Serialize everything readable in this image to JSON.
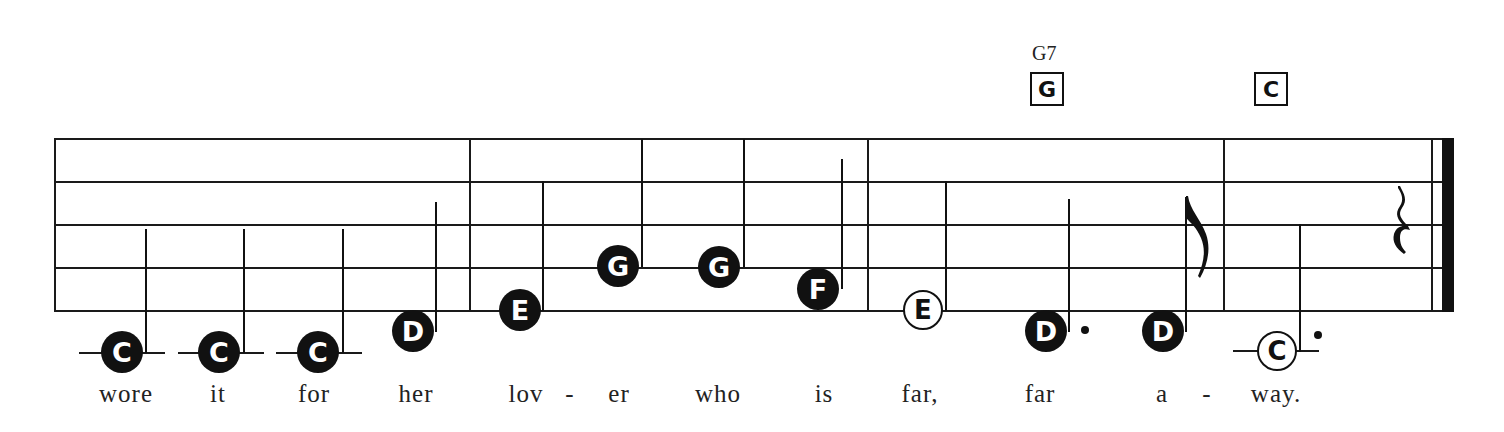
{
  "score": {
    "chords": [
      {
        "name": "G7",
        "box_label": "G",
        "x": 1047
      },
      {
        "name": "",
        "box_label": "C",
        "x": 1269
      }
    ],
    "notes": [
      {
        "label": "C",
        "style": "filled",
        "duration": "quarter",
        "x": 122,
        "y": 352,
        "ledger": true,
        "dotted": false,
        "lyric": "wore"
      },
      {
        "label": "C",
        "style": "filled",
        "duration": "quarter",
        "x": 219,
        "y": 352,
        "ledger": true,
        "dotted": false,
        "lyric": "it"
      },
      {
        "label": "C",
        "style": "filled",
        "duration": "quarter",
        "x": 318,
        "y": 352,
        "ledger": true,
        "dotted": false,
        "lyric": "for"
      },
      {
        "label": "D",
        "style": "filled",
        "duration": "quarter",
        "x": 413,
        "y": 331,
        "ledger": false,
        "dotted": false,
        "lyric": "her"
      },
      {
        "label": "E",
        "style": "filled",
        "duration": "quarter",
        "x": 520,
        "y": 310,
        "ledger": false,
        "dotted": false,
        "lyric": "lov"
      },
      {
        "label": "G",
        "style": "filled",
        "duration": "quarter",
        "x": 618,
        "y": 266,
        "ledger": false,
        "dotted": false,
        "lyric": "er"
      },
      {
        "label": "G",
        "style": "filled",
        "duration": "quarter",
        "x": 718,
        "y": 266,
        "ledger": false,
        "dotted": false,
        "lyric": "who"
      },
      {
        "label": "F",
        "style": "filled",
        "duration": "quarter",
        "x": 818,
        "y": 288,
        "ledger": false,
        "dotted": false,
        "lyric": "is"
      },
      {
        "label": "E",
        "style": "open",
        "duration": "half",
        "x": 923,
        "y": 310,
        "ledger": false,
        "dotted": false,
        "lyric": "far,"
      },
      {
        "label": "D",
        "style": "filled",
        "duration": "dotted-quarter",
        "x": 1046,
        "y": 331,
        "ledger": false,
        "dotted": true,
        "lyric": "far"
      },
      {
        "label": "D",
        "style": "filled",
        "duration": "eighth",
        "x": 1163,
        "y": 331,
        "ledger": false,
        "dotted": false,
        "lyric": "a"
      },
      {
        "label": "C",
        "style": "open",
        "duration": "dotted-half",
        "x": 1277,
        "y": 352,
        "ledger": true,
        "dotted": true,
        "lyric": "way."
      }
    ],
    "hyphens": [
      {
        "text": "-",
        "x": 570
      },
      {
        "text": "-",
        "x": 1207
      }
    ],
    "rest": {
      "type": "quarter-rest",
      "x": 1405,
      "y": 230
    },
    "lyrics_line": "wore it for her lov - er who is far, far a - way."
  }
}
